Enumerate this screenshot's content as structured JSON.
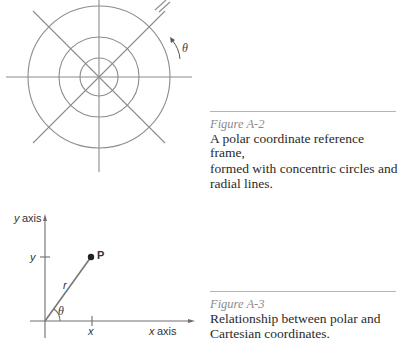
{
  "figure_a2": {
    "label": "Figure A-2",
    "caption": "A polar coordinate reference frame, formed with concentric circles and radial lines.",
    "caption_lines": [
      "A polar coordinate reference frame,",
      "formed with concentric circles and",
      "radial lines."
    ],
    "diagram": {
      "angle_label": "θ",
      "center": [
        99,
        77
      ],
      "circle_radii": [
        19,
        40,
        71
      ],
      "radial_lines": 4
    }
  },
  "figure_a3": {
    "label": "Figure A-3",
    "caption": "Relationship between polar and Cartesian coordinates.",
    "caption_lines": [
      "Relationship between polar and",
      "Cartesian coordinates."
    ],
    "diagram": {
      "y_axis_label": "y axis",
      "x_axis_label": "x axis",
      "y_tick_label": "y",
      "x_tick_label": "x",
      "point_label": "P",
      "radius_label": "r",
      "angle_label": "θ"
    }
  }
}
